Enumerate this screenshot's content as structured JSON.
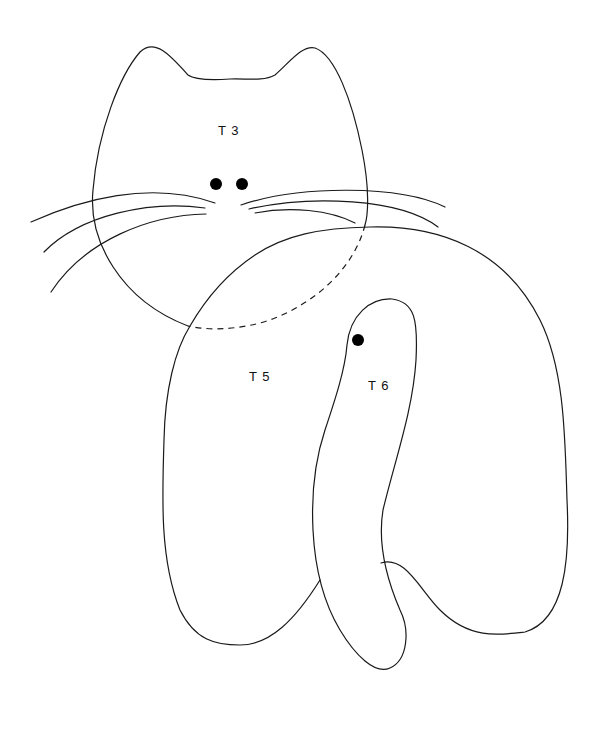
{
  "diagram": {
    "type": "sewing-pattern",
    "pieces": [
      {
        "id": "T3",
        "label": "T 3",
        "part": "head",
        "position": {
          "x": 218,
          "y": 123
        }
      },
      {
        "id": "T5",
        "label": "T 5",
        "part": "body",
        "position": {
          "x": 249,
          "y": 369
        }
      },
      {
        "id": "T6",
        "label": "T 6",
        "part": "tail",
        "position": {
          "x": 368,
          "y": 378
        }
      }
    ],
    "markers": [
      {
        "name": "eye-left",
        "x": 216,
        "y": 184,
        "r": 6
      },
      {
        "name": "eye-right",
        "x": 242,
        "y": 184,
        "r": 6
      },
      {
        "name": "tail-placement-dot",
        "x": 358,
        "y": 340,
        "r": 6
      }
    ],
    "line_color": "#1a1a1a",
    "background": "#ffffff",
    "hidden_edge_style": "dashed"
  }
}
